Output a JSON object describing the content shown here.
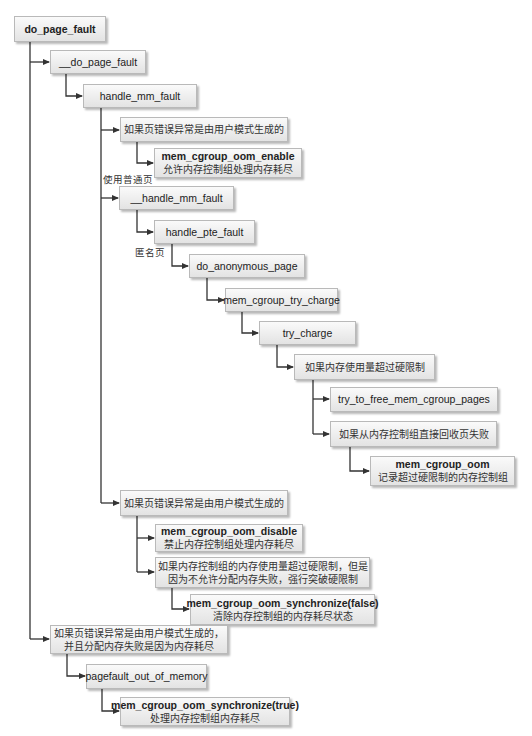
{
  "diagram": {
    "title": "do_page_fault",
    "colors": {
      "line": "#333333",
      "box_border": "#b9b9b9",
      "box_top": "#fafafa",
      "box_bottom": "#e3e3e3"
    },
    "nodes": [
      {
        "id": "do_page_fault",
        "fn": "do_page_fault"
      },
      {
        "id": "__do_page_fault",
        "fn": "__do_page_fault"
      },
      {
        "id": "handle_mm_fault",
        "fn": "handle_mm_fault"
      },
      {
        "id": "cond_user_mode_1",
        "text": "如果页错误异常是由用户模式生成的"
      },
      {
        "id": "mem_cgroup_oom_enable",
        "fn": "mem_cgroup_oom_enable",
        "desc": "允许内存控制组处理内存耗尽"
      },
      {
        "id": "__handle_mm_fault",
        "fn": "__handle_mm_fault"
      },
      {
        "id": "handle_pte_fault",
        "fn": "handle_pte_fault"
      },
      {
        "id": "do_anonymous_page",
        "fn": "do_anonymous_page"
      },
      {
        "id": "mem_cgroup_try_charge",
        "fn": "mem_cgroup_try_charge"
      },
      {
        "id": "try_charge",
        "fn": "try_charge"
      },
      {
        "id": "cond_exceed_hard_limit",
        "text": "如果内存使用量超过硬限制"
      },
      {
        "id": "try_to_free_mem_cgroup_pages",
        "fn": "try_to_free_mem_cgroup_pages"
      },
      {
        "id": "cond_reclaim_failed",
        "text": "如果从内存控制组直接回收页失败"
      },
      {
        "id": "mem_cgroup_oom",
        "fn": "mem_cgroup_oom",
        "desc": "记录超过硬限制的内存控制组"
      },
      {
        "id": "cond_user_mode_2",
        "text": "如果页错误异常是由用户模式生成的"
      },
      {
        "id": "mem_cgroup_oom_disable",
        "fn": "mem_cgroup_oom_disable",
        "desc": "禁止内存控制组处理内存耗尽"
      },
      {
        "id": "cond_breach_limit",
        "text_line1": "如果内存控制组的内存使用量超过硬限制，但是",
        "text_line2": "因为不允许分配内存失败，强行突破硬限制"
      },
      {
        "id": "mem_cgroup_oom_synchronize_false",
        "fn": "mem_cgroup_oom_synchronize(false)",
        "desc": "清除内存控制组的内存耗尽状态"
      },
      {
        "id": "cond_user_mode_oom",
        "text_line1": "如果页错误异常是由用户模式生成的，",
        "text_line2": "并且分配内存失败是因为内存耗尽"
      },
      {
        "id": "pagefault_out_of_memory",
        "fn": "pagefault_out_of_memory"
      },
      {
        "id": "mem_cgroup_oom_synchronize_true",
        "fn": "mem_cgroup_oom_synchronize(true)",
        "desc": "处理内存控制组内存耗尽"
      }
    ],
    "edge_labels": {
      "normal_page": "使用普通页",
      "anonymous_page": "匿名页"
    }
  }
}
